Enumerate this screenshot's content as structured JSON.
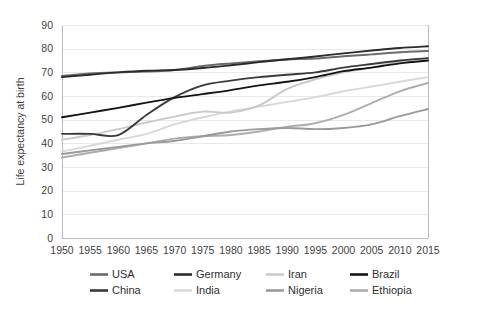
{
  "chart_data": {
    "type": "line",
    "title": "",
    "xlabel": "",
    "ylabel": "Life expectancy at birth",
    "xlim": [
      1950,
      2015
    ],
    "ylim": [
      0,
      90
    ],
    "y_ticks": [
      0,
      10,
      20,
      30,
      40,
      50,
      60,
      70,
      80,
      90
    ],
    "x_ticks": [
      1950,
      1955,
      1960,
      1965,
      1970,
      1975,
      1980,
      1985,
      1990,
      1995,
      2000,
      2005,
      2010,
      2015
    ],
    "x": [
      1950,
      1955,
      1960,
      1965,
      1970,
      1975,
      1980,
      1985,
      1990,
      1995,
      2000,
      2005,
      2010,
      2015
    ],
    "grid": "horizontal",
    "legend_position": "bottom",
    "series": [
      {
        "name": "USA",
        "color": "#6b6b6b",
        "values": [
          68.5,
          69.5,
          70.0,
          70.3,
          71.0,
          72.7,
          73.8,
          74.7,
          75.4,
          75.8,
          76.8,
          77.6,
          78.5,
          79.0
        ]
      },
      {
        "name": "Germany",
        "color": "#2b2b2b",
        "values": [
          68.0,
          69.0,
          70.0,
          70.7,
          71.0,
          71.8,
          73.0,
          74.3,
          75.5,
          76.7,
          78.0,
          79.2,
          80.3,
          81.0
        ]
      },
      {
        "name": "Iran",
        "color": "#c9c9c9",
        "values": [
          41.5,
          43.5,
          46.0,
          48.8,
          51.3,
          53.4,
          53.0,
          56.0,
          63.0,
          67.0,
          70.0,
          72.0,
          74.5,
          76.0
        ]
      },
      {
        "name": "Brazil",
        "color": "#141414",
        "values": [
          51.0,
          53.0,
          55.0,
          57.2,
          59.2,
          60.8,
          62.5,
          64.5,
          66.0,
          68.0,
          70.5,
          72.0,
          73.8,
          75.0
        ]
      },
      {
        "name": "China",
        "color": "#3a3a3a",
        "values": [
          44.0,
          44.0,
          43.5,
          52.0,
          59.5,
          64.5,
          66.5,
          68.0,
          69.0,
          70.0,
          72.0,
          73.5,
          75.0,
          76.0
        ]
      },
      {
        "name": "India",
        "color": "#d8d8d8",
        "values": [
          36.5,
          39.0,
          41.5,
          44.0,
          48.0,
          51.0,
          53.5,
          55.5,
          57.5,
          59.5,
          62.0,
          64.0,
          66.0,
          68.0
        ]
      },
      {
        "name": "Nigeria",
        "color": "#9a9a9a",
        "values": [
          35.5,
          37.0,
          38.5,
          40.0,
          41.0,
          43.0,
          45.0,
          46.0,
          46.5,
          46.0,
          46.5,
          48.0,
          51.5,
          54.5
        ]
      },
      {
        "name": "Ethiopia",
        "color": "#adadad",
        "values": [
          34.0,
          36.0,
          38.0,
          40.0,
          42.0,
          43.0,
          43.5,
          45.0,
          47.0,
          48.5,
          52.0,
          57.0,
          62.0,
          65.5
        ]
      }
    ],
    "legend": [
      {
        "label": "USA",
        "color": "#6b6b6b"
      },
      {
        "label": "Germany",
        "color": "#2b2b2b"
      },
      {
        "label": "Iran",
        "color": "#c9c9c9"
      },
      {
        "label": "Brazil",
        "color": "#141414"
      },
      {
        "label": "China",
        "color": "#3a3a3a"
      },
      {
        "label": "India",
        "color": "#d8d8d8"
      },
      {
        "label": "Nigeria",
        "color": "#9a9a9a"
      },
      {
        "label": "Ethiopia",
        "color": "#adadad"
      }
    ]
  },
  "colors": {
    "background": "#ffffff",
    "grid": "#e9e9e9",
    "axis": "#b9b9b9",
    "text": "#3f3f3f"
  }
}
